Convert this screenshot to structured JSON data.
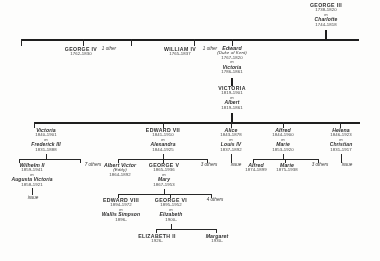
{
  "colors": {
    "ink": "#1f1f1f",
    "paper": "#fdfdfc"
  },
  "generations": [
    {
      "id": "gen1",
      "people": [
        {
          "id": "george3",
          "name": "GEORGE III",
          "dates": "1738-1820",
          "marriage_mark": "m",
          "spouse": "Charlotte",
          "spouse_dates": "1744-1818"
        }
      ]
    },
    {
      "id": "gen2",
      "people": [
        {
          "id": "george4",
          "name": "GEORGE IV",
          "dates": "1762-1830"
        },
        {
          "id": "other1",
          "name": "1 other"
        },
        {
          "id": "william4",
          "name": "WILLIAM IV",
          "dates": "1765-1837"
        },
        {
          "id": "other2",
          "name": "1 other"
        },
        {
          "id": "edward-kent",
          "name": "Edward",
          "name_sub": "(Duke of Kent)",
          "dates": "1767-1820",
          "marriage_mark": "m",
          "spouse": "Victoria",
          "spouse_dates": "1786-1861"
        }
      ]
    },
    {
      "id": "gen3",
      "people": [
        {
          "id": "victoria",
          "name": "VICTORIA",
          "dates": "1819-1901",
          "marriage_mark": "m",
          "spouse": "Albert",
          "spouse_dates": "1819-1861"
        }
      ]
    },
    {
      "id": "gen4",
      "people": [
        {
          "id": "victoria-pr",
          "name": "Victoria",
          "dates": "1840-1901",
          "marriage_mark": "m",
          "spouse": "Frederick III",
          "spouse_dates": "1831-1888"
        },
        {
          "id": "edward7",
          "name": "EDWARD VII",
          "dates": "1841-1910",
          "marriage_mark": "m",
          "spouse": "Alexandra",
          "spouse_dates": "1844-1925"
        },
        {
          "id": "alice",
          "name": "Alice",
          "dates": "1843-1878",
          "marriage_mark": "m",
          "spouse": "Louis IV",
          "spouse_dates": "1837-1892"
        },
        {
          "id": "alfred",
          "name": "Alfred",
          "dates": "1844-1900",
          "marriage_mark": "m",
          "spouse": "Marie",
          "spouse_dates": "1853-1920"
        },
        {
          "id": "helena",
          "name": "Helena",
          "dates": "1846-1923",
          "marriage_mark": "m",
          "spouse": "Christian",
          "spouse_dates": "1831-1917"
        }
      ]
    },
    {
      "id": "gen5",
      "people": [
        {
          "id": "wilhelm2",
          "name": "Wilhelm II",
          "dates": "1859-1941",
          "marriage_mark": "m",
          "spouse": "Augusta Victoria",
          "spouse_dates": "1858-1921"
        },
        {
          "id": "others7",
          "name": "7 others"
        },
        {
          "id": "albert-victor",
          "name": "Albert Victor",
          "name_sub": "(Eddy)",
          "dates": "1864-1892"
        },
        {
          "id": "george5",
          "name": "GEORGE V",
          "dates": "1865-1936",
          "marriage_mark": "m",
          "spouse": "Mary",
          "spouse_dates": "1867-1953"
        },
        {
          "id": "others3a",
          "name": "3 others"
        },
        {
          "id": "issue-alice",
          "name": "issue"
        },
        {
          "id": "alfred-jr",
          "name": "Alfred",
          "dates": "1874-1899"
        },
        {
          "id": "marie-jr",
          "name": "Marie",
          "dates": "1875-1938"
        },
        {
          "id": "others3b",
          "name": "3 others"
        },
        {
          "id": "issue-helena",
          "name": "issue"
        }
      ]
    },
    {
      "id": "gen6",
      "people": [
        {
          "id": "issue-wilhelm",
          "name": "issue"
        },
        {
          "id": "edward8",
          "name": "EDWARD VIII",
          "dates": "1894-1972",
          "marriage_mark": "m",
          "spouse": "Wallis Simpson",
          "spouse_dates": "1896-"
        },
        {
          "id": "george6",
          "name": "GEORGE VI",
          "dates": "1895-1952",
          "marriage_mark": "m",
          "spouse": "Elizabeth",
          "spouse_dates": "1900-"
        },
        {
          "id": "others4",
          "name": "4 others"
        }
      ]
    },
    {
      "id": "gen7",
      "people": [
        {
          "id": "elizabeth2",
          "name": "ELIZABETH II",
          "dates": "1926-"
        },
        {
          "id": "margaret",
          "name": "Margaret",
          "dates": "1930-"
        }
      ]
    }
  ]
}
